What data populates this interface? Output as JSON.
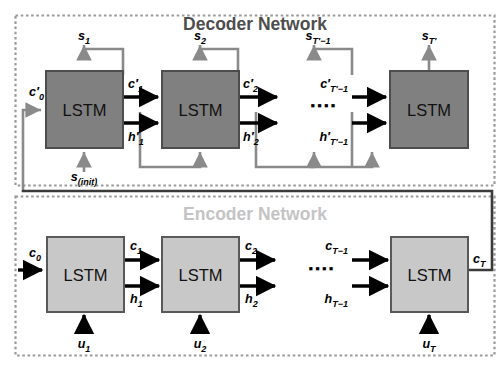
{
  "figure": {
    "type": "diagram"
  },
  "decoder": {
    "title": "Decoder Network",
    "title_color": "#4d4d4d",
    "block_fill": "#808080",
    "block_stroke": "#4d4d4d",
    "block_label": "LSTM",
    "blocks": [
      {
        "label": "LSTM"
      },
      {
        "label": "LSTM"
      },
      {
        "label": "LSTM"
      }
    ],
    "ellipsis": "▪▪▪▪",
    "labels": {
      "s1": "s",
      "s1_sub": "1",
      "s2": "s",
      "s2_sub": "2",
      "s3": "s",
      "s3_sub": "T′−1",
      "s4": "s",
      "s4_sub": "T′",
      "c0": "c′",
      "c0_sub": "0",
      "c1": "c′",
      "c1_sub": "1",
      "c2": "c′",
      "c2_sub": "2",
      "c3": "c′",
      "c3_sub": "T′−1",
      "h1": "h′",
      "h1_sub": "1",
      "h2": "h′",
      "h2_sub": "2",
      "h3": "h′",
      "h3_sub": "T′−1",
      "sinit": "s",
      "sinit_sub": "(init)"
    }
  },
  "encoder": {
    "title": "Encoder Network",
    "title_color": "#c4c4c4",
    "block_fill": "#c8c8c8",
    "block_stroke": "#595959",
    "block_label": "LSTM",
    "blocks": [
      {
        "label": "LSTM"
      },
      {
        "label": "LSTM"
      },
      {
        "label": "LSTM"
      }
    ],
    "ellipsis": "▪▪▪▪",
    "labels": {
      "c0": "c",
      "c0_sub": "0",
      "c1": "c",
      "c1_sub": "1",
      "c2": "c",
      "c2_sub": "2",
      "c3": "c",
      "c3_sub": "T−1",
      "cT": "c",
      "cT_sub": "T",
      "h1": "h",
      "h1_sub": "1",
      "h2": "h",
      "h2_sub": "2",
      "h3": "h",
      "h3_sub": "T−1",
      "u1": "u",
      "u1_sub": "1",
      "u2": "u",
      "u2_sub": "2",
      "uT": "u",
      "uT_sub": "T"
    }
  },
  "colors": {
    "black": "#000000",
    "gray_wire": "#8a8a8a",
    "dashed_border": "#9a9a9a",
    "background": "#ffffff"
  }
}
